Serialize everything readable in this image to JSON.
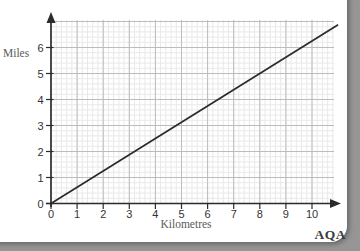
{
  "chart_data": {
    "type": "line",
    "title": "",
    "xlabel": "Kilometres",
    "ylabel": "Miles",
    "annotation": "AQA",
    "xlim": [
      0,
      10.85
    ],
    "ylim": [
      0,
      7.05
    ],
    "x_ticks": [
      0,
      1,
      2,
      3,
      4,
      5,
      6,
      7,
      8,
      9,
      10
    ],
    "y_ticks": [
      0,
      1,
      2,
      3,
      4,
      5,
      6
    ],
    "minor_per_major": 5,
    "grid": "on",
    "legend": "none",
    "series": [
      {
        "name": "kilometres-to-miles-conversion-line",
        "x": [
          0,
          11
        ],
        "y": [
          0,
          6.875
        ],
        "slope_miles_per_km": 0.625,
        "note": "straight line through origin; 8 km = 5 miles"
      }
    ]
  },
  "colors": {
    "background": "#969696",
    "card": "#ffffff",
    "minor_grid": "#e9e9e9",
    "major_grid": "#bcbcbc",
    "axis": "#2b2b2b",
    "series_line": "#2b2b2b",
    "tick_label": "#333333",
    "axis_title": "#5a5a5a"
  }
}
